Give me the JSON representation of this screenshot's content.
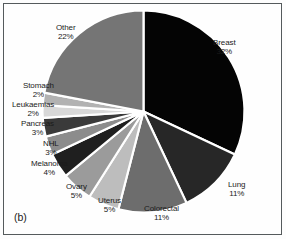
{
  "figure": {
    "panel_label": "(b)",
    "background_color": "#fefefe",
    "border_color": "#555a5c"
  },
  "chart_data": {
    "type": "pie",
    "title": "",
    "subtitle": "",
    "xlabel": "",
    "ylabel": "",
    "legend_position": "none",
    "grid": false,
    "start_angle_deg": 0,
    "direction": "clockwise",
    "units": "percent",
    "total": 100,
    "categories": [
      "Breast",
      "Lung",
      "Colorectal",
      "Uterus",
      "Ovary",
      "Melanoma",
      "NHL",
      "Pancreas",
      "Leukaemias",
      "Stomach",
      "Other"
    ],
    "values": [
      32,
      11,
      11,
      5,
      5,
      4,
      3,
      3,
      2,
      2,
      22
    ],
    "labels": [
      "Breast 32%",
      "Lung 11%",
      "Colorectal 11%",
      "Uterus 5%",
      "Ovary 5%",
      "Melanoma 4%",
      "NHL 3%",
      "Pancreas 3%",
      "Leukaemias 2%",
      "Stomach 2%",
      "Other 22%"
    ],
    "colors": [
      "#040404",
      "#272727",
      "#6d6d6d",
      "#bdbdbd",
      "#9b9b9b",
      "#1f1f1f",
      "#8c8c8c",
      "#3a3a3a",
      "#d8d8d8",
      "#b2b2b2",
      "#757575"
    ],
    "slices": [
      {
        "name": "Breast",
        "value": 32,
        "percent_text": "32%",
        "color": "#040404"
      },
      {
        "name": "Lung",
        "value": 11,
        "percent_text": "11%",
        "color": "#272727"
      },
      {
        "name": "Colorectal",
        "value": 11,
        "percent_text": "11%",
        "color": "#6d6d6d"
      },
      {
        "name": "Uterus",
        "value": 5,
        "percent_text": "5%",
        "color": "#bdbdbd"
      },
      {
        "name": "Ovary",
        "value": 5,
        "percent_text": "5%",
        "color": "#9b9b9b"
      },
      {
        "name": "Melanoma",
        "value": 4,
        "percent_text": "4%",
        "color": "#1f1f1f"
      },
      {
        "name": "NHL",
        "value": 3,
        "percent_text": "3%",
        "color": "#8c8c8c"
      },
      {
        "name": "Pancreas",
        "value": 3,
        "percent_text": "3%",
        "color": "#3a3a3a"
      },
      {
        "name": "Leukaemias",
        "value": 2,
        "percent_text": "2%",
        "color": "#d8d8d8"
      },
      {
        "name": "Stomach",
        "value": 2,
        "percent_text": "2%",
        "color": "#b2b2b2"
      },
      {
        "name": "Other",
        "value": 22,
        "percent_text": "22%",
        "color": "#757575"
      }
    ]
  },
  "labels": {
    "breast": {
      "name": "Breast",
      "value": "32%"
    },
    "lung": {
      "name": "Lung",
      "value": "11%"
    },
    "colorectal": {
      "name": "Colorectal",
      "value": "11%"
    },
    "uterus": {
      "name": "Uterus",
      "value": "5%"
    },
    "ovary": {
      "name": "Ovary",
      "value": "5%"
    },
    "melanoma": {
      "name": "Melanoma",
      "value": "4%"
    },
    "nhl": {
      "name": "NHL",
      "value": "3%"
    },
    "pancreas": {
      "name": "Pancreas",
      "value": "3%"
    },
    "leukaemias": {
      "name": "Leukaemias",
      "value": "2%"
    },
    "stomach": {
      "name": "Stomach",
      "value": "2%"
    },
    "other": {
      "name": "Other",
      "value": "22%"
    }
  }
}
